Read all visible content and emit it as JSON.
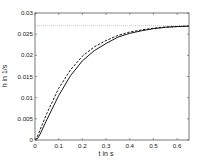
{
  "chart_data": {
    "type": "line",
    "title": "",
    "xlabel": "t in s",
    "ylabel": "h in 1/s",
    "xlim": [
      0,
      0.65
    ],
    "ylim": [
      0,
      0.03
    ],
    "xticks": [
      0,
      0.1,
      0.2,
      0.3,
      0.4,
      0.5,
      0.6
    ],
    "xtick_labels": [
      "0",
      "0.1",
      "0.2",
      "0.3",
      "0.4",
      "0.5",
      "0.6"
    ],
    "yticks": [
      0,
      0.005,
      0.01,
      0.015,
      0.02,
      0.025,
      0.03
    ],
    "ytick_labels": [
      "0",
      "0.005",
      "0.01",
      "0.015",
      "0.02",
      "0.025",
      "0.03"
    ],
    "grid": false,
    "reference_line": {
      "y": 0.027,
      "style": "dotted",
      "color": "#bbbbbb"
    },
    "series": [
      {
        "name": "solid",
        "style": "solid",
        "color": "#000000",
        "x": [
          0,
          0.01,
          0.02,
          0.05,
          0.1,
          0.15,
          0.2,
          0.25,
          0.3,
          0.35,
          0.4,
          0.45,
          0.5,
          0.55,
          0.6,
          0.65
        ],
        "y": [
          0,
          0.0003,
          0.0012,
          0.0048,
          0.0105,
          0.0152,
          0.0187,
          0.0211,
          0.0228,
          0.0243,
          0.0252,
          0.0258,
          0.0263,
          0.0266,
          0.0268,
          0.0269
        ]
      },
      {
        "name": "dashed",
        "style": "dashed",
        "color": "#000000",
        "x": [
          0,
          0.01,
          0.02,
          0.05,
          0.1,
          0.15,
          0.2,
          0.25,
          0.3,
          0.35,
          0.4,
          0.45,
          0.5,
          0.55,
          0.6,
          0.65
        ],
        "y": [
          0,
          0.0008,
          0.0022,
          0.0063,
          0.0122,
          0.0166,
          0.0198,
          0.022,
          0.0235,
          0.0247,
          0.0255,
          0.026,
          0.0264,
          0.0267,
          0.0268,
          0.0269
        ]
      }
    ]
  }
}
